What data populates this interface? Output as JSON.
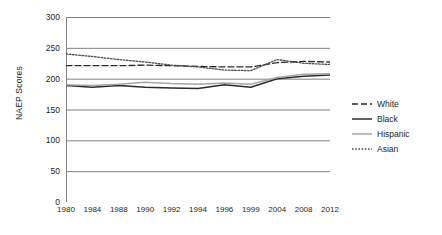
{
  "chart_data": {
    "type": "line",
    "title": "",
    "xlabel": "",
    "ylabel": "NAEP Scores",
    "ylim": [
      0,
      300
    ],
    "yticks": [
      0,
      50,
      100,
      150,
      200,
      250,
      300
    ],
    "grid": true,
    "grid_axis": "y",
    "legend_position": "right",
    "categories": [
      "1980",
      "1984",
      "1988",
      "1990",
      "1992",
      "1994",
      "1996",
      "1999",
      "2004",
      "2008",
      "2012"
    ],
    "series": [
      {
        "name": "White",
        "style": "dashed",
        "color": "#2b2b2b",
        "values": [
          221,
          221,
          221,
          222,
          221,
          220,
          219,
          219,
          226,
          228,
          227
        ]
      },
      {
        "name": "Black",
        "style": "solid",
        "color": "#2b2b2b",
        "values": [
          189,
          186,
          189,
          186,
          185,
          184,
          190,
          186,
          200,
          204,
          206
        ]
      },
      {
        "name": "Hispanic",
        "style": "solid",
        "color": "#a6a6a6",
        "values": [
          190,
          189,
          191,
          194,
          192,
          191,
          193,
          191,
          202,
          207,
          208
        ]
      },
      {
        "name": "Asian",
        "style": "dotted",
        "color": "#4d4d4d",
        "values": [
          240,
          236,
          231,
          227,
          222,
          219,
          214,
          213,
          231,
          225,
          223
        ]
      }
    ]
  },
  "legend": {
    "items": [
      {
        "label": "White"
      },
      {
        "label": "Black"
      },
      {
        "label": "Hispanic"
      },
      {
        "label": "Asian"
      }
    ]
  },
  "axes": {
    "y_title": "NAEP Scores"
  }
}
